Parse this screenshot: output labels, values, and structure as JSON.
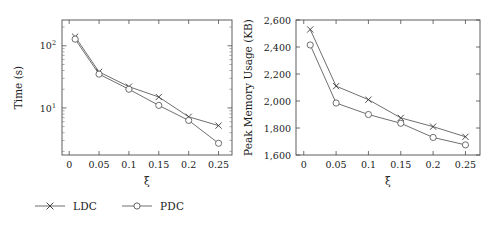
{
  "figure": {
    "legend": [
      {
        "label": "LDC",
        "marker": "x-marker",
        "color": "#3a3a3a"
      },
      {
        "label": "PDC",
        "marker": "circle-marker",
        "color": "#555555"
      }
    ]
  },
  "chart_data": [
    {
      "type": "line",
      "title": "",
      "xlabel": "ξ",
      "ylabel": "Time (s)",
      "yscale": "log",
      "xscale": "linear",
      "xlim": [
        -0.012,
        0.2725
      ],
      "ylim": [
        1.75,
        260
      ],
      "xticks": [
        0,
        0.05,
        0.1,
        0.15,
        0.2,
        0.25
      ],
      "xticklabels": [
        "0",
        "0.05",
        "0.1",
        "0.15",
        "0.2",
        "0.25"
      ],
      "yticks": [
        10,
        100
      ],
      "yticklabels": [
        "10¹",
        "10²"
      ],
      "grid": false,
      "legend_position": "below-figure",
      "x": [
        0.01,
        0.05,
        0.1,
        0.15,
        0.2,
        0.25
      ],
      "series": [
        {
          "name": "LDC",
          "values": [
            140,
            38,
            22,
            15,
            7.2,
            5.2
          ]
        },
        {
          "name": "PDC",
          "values": [
            128,
            35,
            20,
            11,
            6.3,
            2.7
          ]
        }
      ]
    },
    {
      "type": "line",
      "title": "",
      "xlabel": "ξ",
      "ylabel": "Peak Memory Usage (KB)",
      "yscale": "linear",
      "xscale": "linear",
      "xlim": [
        -0.012,
        0.2725
      ],
      "ylim": [
        1600,
        2600
      ],
      "xticks": [
        0,
        0.05,
        0.1,
        0.15,
        0.2,
        0.25
      ],
      "xticklabels": [
        "0",
        "0.05",
        "0.1",
        "0.15",
        "0.2",
        "0.25"
      ],
      "yticks": [
        1600,
        1800,
        2000,
        2200,
        2400,
        2600
      ],
      "yticklabels": [
        "1,600",
        "1,800",
        "2,000",
        "2,200",
        "2,400",
        "2,600"
      ],
      "grid": false,
      "legend_position": "below-figure",
      "x": [
        0.01,
        0.05,
        0.1,
        0.15,
        0.2,
        0.25
      ],
      "series": [
        {
          "name": "LDC",
          "values": [
            2530,
            2110,
            2010,
            1875,
            1810,
            1735
          ]
        },
        {
          "name": "PDC",
          "values": [
            2415,
            1985,
            1900,
            1835,
            1730,
            1675
          ]
        }
      ]
    }
  ]
}
